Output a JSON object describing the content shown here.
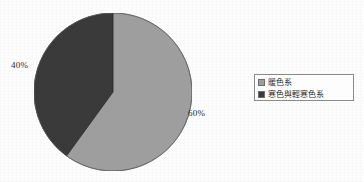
{
  "chart_data": {
    "type": "pie",
    "title": "",
    "categories": [
      "暖色系",
      "寒色與輕寒色系"
    ],
    "values": [
      60,
      40
    ],
    "value_labels": [
      "60%",
      "40%"
    ],
    "colors": [
      "#9e9e9e",
      "#3a3a3a"
    ],
    "start_angle_deg": 0,
    "direction": "clockwise",
    "legend_position": "right",
    "grid": false,
    "slices": [
      {
        "label": "暖色系",
        "value": 60,
        "value_label": "60%",
        "color": "#9e9e9e",
        "start_deg": 0,
        "end_deg": 216
      },
      {
        "label": "寒色與輕寒色系",
        "value": 40,
        "value_label": "40%",
        "color": "#3a3a3a",
        "start_deg": 216,
        "end_deg": 360
      }
    ]
  },
  "labels": {
    "left_pct": "40%",
    "right_pct": "60%"
  },
  "legend": {
    "items": [
      {
        "label": "暖色系",
        "color": "#9e9e9e"
      },
      {
        "label": "寒色與輕寒色系",
        "color": "#3a3a3a"
      }
    ]
  },
  "colors": {
    "warm_slice": "#9e9e9e",
    "cool_slice": "#3a3a3a",
    "legend_border": "#8a8a8a",
    "text": "#2b2b2b",
    "background": "#fdfdfd"
  }
}
